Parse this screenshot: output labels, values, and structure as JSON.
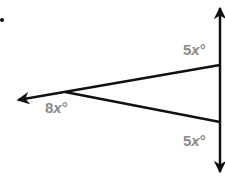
{
  "diagram": {
    "type": "geometry-angles",
    "dot": {
      "x": 2,
      "y": 20
    },
    "vertical_line": {
      "x": 220,
      "y1": 6,
      "y2": 174,
      "arrows": [
        "up",
        "down"
      ]
    },
    "upper_ray": {
      "from": [
        220,
        65
      ],
      "to": [
        18,
        100
      ],
      "arrow": "left"
    },
    "lower_segment": {
      "from": [
        65,
        92
      ],
      "to": [
        220,
        122
      ]
    },
    "labels": {
      "top_right": {
        "coef": "5",
        "var": "x",
        "deg": "°"
      },
      "vertex": {
        "coef": "8",
        "var": "x",
        "deg": "°"
      },
      "bottom_right": {
        "coef": "5",
        "var": "x",
        "deg": "°"
      }
    },
    "colors": {
      "line": "#111111",
      "label": "#8a8a8a"
    }
  }
}
